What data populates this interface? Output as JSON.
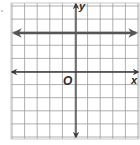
{
  "graph": {
    "axis_labels": {
      "x": "x",
      "y": "y",
      "origin": "O"
    },
    "grid": {
      "columns": 10,
      "rows": 10,
      "x_min": -5,
      "x_max": 5,
      "y_min": -5,
      "y_max": 5
    },
    "colors": {
      "grid": "#9a9a9a",
      "axis": "#3a3a3a",
      "line": "#555555",
      "background": "#ffffff"
    }
  },
  "chart_data": {
    "type": "line",
    "title": "",
    "xlabel": "x",
    "ylabel": "y",
    "xlim": [
      -5,
      5
    ],
    "ylim": [
      -5,
      5
    ],
    "grid": true,
    "series": [
      {
        "name": "horizontal line",
        "equation": "y = 3",
        "x": [
          -5,
          5
        ],
        "y": [
          3,
          3
        ],
        "arrows": "both"
      }
    ]
  }
}
